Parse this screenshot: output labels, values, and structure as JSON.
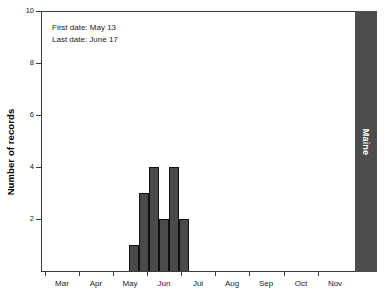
{
  "chart_data": {
    "type": "bar",
    "title": "",
    "xlabel": "",
    "ylabel": "Number of records",
    "ylim": [
      0,
      10
    ],
    "yticks": [
      2,
      4,
      6,
      8,
      10
    ],
    "ytick_labels": [
      "2",
      "4",
      "6",
      "8",
      "10"
    ],
    "grid": false,
    "legend": "none",
    "x_axis_type": "month",
    "xtick_labels": [
      "Mar",
      "Apr",
      "May",
      "Jun",
      "Jul",
      "Aug",
      "Sep",
      "Oct",
      "Nov"
    ],
    "categories": [
      "May 13",
      "May 20",
      "May 27",
      "Jun 3",
      "Jun 10",
      "Jun 17"
    ],
    "values": [
      1,
      3,
      4,
      2,
      4,
      2
    ],
    "bar_color": "#4a4a4a",
    "bar_edge_color": "#111111",
    "annotations": [
      "First date: May 13",
      "Last date: June 17"
    ],
    "panel_label": "Maine",
    "panel_label_color": "#ffffff",
    "panel_strip_color": "#4d4d4d"
  },
  "chart": {
    "y_axis_title": "Number of records",
    "annotation_line1": "First date: May 13",
    "annotation_line2": "Last date: June 17",
    "state_label": "Maine"
  }
}
